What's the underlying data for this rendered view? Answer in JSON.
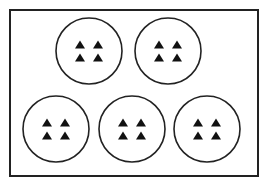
{
  "diagram": {
    "colors": {
      "stroke": "#222222",
      "fill": "#111111",
      "background": "#ffffff"
    },
    "frame": {
      "x": 10,
      "y": 10,
      "width": 248,
      "height": 166
    },
    "group_radius": 33,
    "triangles_per_group": 4,
    "group_count": 5,
    "groups": [
      {
        "cx": 89,
        "cy": 51
      },
      {
        "cx": 168,
        "cy": 51
      },
      {
        "cx": 56,
        "cy": 129
      },
      {
        "cx": 132,
        "cy": 129
      },
      {
        "cx": 207,
        "cy": 129
      }
    ],
    "triangle": {
      "width": 10,
      "height": 8,
      "dx": 9,
      "dy": 6.5
    }
  }
}
